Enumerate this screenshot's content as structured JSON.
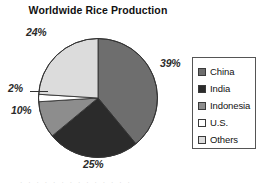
{
  "chart_data": {
    "type": "pie",
    "title": "Worldwide Rice Production",
    "categories": [
      "China",
      "India",
      "Indonesia",
      "U.S.",
      "Others"
    ],
    "values": [
      39,
      25,
      10,
      2,
      24
    ],
    "value_labels": [
      "39%",
      "25%",
      "10%",
      "2%",
      "24%"
    ],
    "unit": "percent",
    "colors": [
      "#6e6e6e",
      "#2b2b2b",
      "#8d8d8d",
      "#ffffff",
      "#dcdcdc"
    ],
    "legend_position": "right",
    "start_angle_deg": 0,
    "direction": "clockwise",
    "grid": false,
    "xlabel": "",
    "ylabel": ""
  },
  "legend": {
    "items": [
      {
        "label": "China",
        "color": "#6e6e6e"
      },
      {
        "label": "India",
        "color": "#2b2b2b"
      },
      {
        "label": "Indonesia",
        "color": "#8d8d8d"
      },
      {
        "label": "U.S.",
        "color": "#ffffff"
      },
      {
        "label": "Others",
        "color": "#dcdcdc"
      }
    ]
  },
  "artifact": {
    "text": "· · · · · · · · · · · · · ·"
  }
}
